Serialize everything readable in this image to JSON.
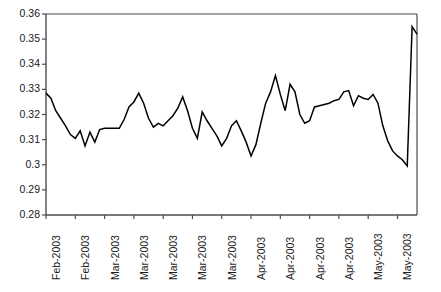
{
  "chart_data": {
    "type": "line",
    "title": "",
    "subtitle": "",
    "xlabel": "",
    "ylabel": "",
    "grid": false,
    "legend": false,
    "legend_position": "none",
    "line_color": "#000000",
    "axis_color": "#4d4d4d",
    "background_color": "#ffffff",
    "ylim": [
      0.28,
      0.36
    ],
    "ytick_labels": [
      "0.36",
      "0.35",
      "0.34",
      "0.33",
      "0.32",
      "0.31",
      "0.3",
      "0.29",
      "0.28"
    ],
    "ytick_values": [
      0.36,
      0.35,
      0.34,
      0.33,
      0.32,
      0.31,
      0.3,
      0.29,
      0.28
    ],
    "xtick_labels": [
      "Feb-2003",
      "Feb-2003",
      "Mar-2003",
      "Mar-2003",
      "Mar-2003",
      "Mar-2003",
      "Mar-2003",
      "Apr-2003",
      "Apr-2003",
      "Apr-2003",
      "Apr-2003",
      "May-2003",
      "May-2003"
    ],
    "xtick_indices": [
      0,
      6,
      12,
      18,
      24,
      30,
      36,
      42,
      48,
      54,
      60,
      66,
      72
    ],
    "x": [
      0,
      1,
      2,
      3,
      4,
      5,
      6,
      7,
      8,
      9,
      10,
      11,
      12,
      13,
      14,
      15,
      16,
      17,
      18,
      19,
      20,
      21,
      22,
      23,
      24,
      25,
      26,
      27,
      28,
      29,
      30,
      31,
      32,
      33,
      34,
      35,
      36,
      37,
      38,
      39,
      40,
      41,
      42,
      43,
      44,
      45,
      46,
      47,
      48,
      49,
      50,
      51,
      52,
      53,
      54,
      55,
      56,
      57,
      58,
      59,
      60,
      61,
      62,
      63,
      64,
      65,
      66,
      67,
      68,
      69,
      70,
      71,
      72,
      73,
      74,
      75,
      76
    ],
    "values": [
      0.3285,
      0.3265,
      0.3215,
      0.3185,
      0.3155,
      0.312,
      0.3105,
      0.3135,
      0.3075,
      0.313,
      0.309,
      0.314,
      0.3145,
      0.3145,
      0.3145,
      0.3145,
      0.318,
      0.323,
      0.325,
      0.3285,
      0.3245,
      0.3185,
      0.315,
      0.3165,
      0.3155,
      0.3175,
      0.3195,
      0.3225,
      0.327,
      0.3215,
      0.3145,
      0.3105,
      0.321,
      0.3175,
      0.3145,
      0.3115,
      0.3075,
      0.3105,
      0.3155,
      0.3175,
      0.3135,
      0.309,
      0.3035,
      0.308,
      0.3165,
      0.3245,
      0.329,
      0.3355,
      0.328,
      0.3215,
      0.332,
      0.329,
      0.32,
      0.3165,
      0.3175,
      0.323,
      0.3235,
      0.324,
      0.3245,
      0.3255,
      0.326,
      0.329,
      0.3295,
      0.3235,
      0.3275,
      0.3265,
      0.326,
      0.328,
      0.3245,
      0.3155,
      0.3095,
      0.3055,
      0.3035,
      0.302,
      0.2995,
      0.355,
      0.352
    ]
  }
}
